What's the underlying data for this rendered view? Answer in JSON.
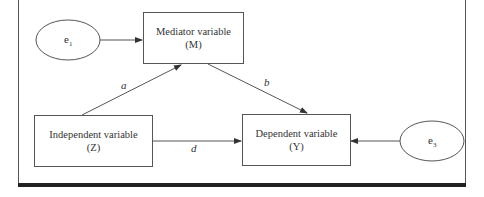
{
  "diagram": {
    "type": "mediation-model",
    "nodes": {
      "mediator": {
        "line1": "Mediator variable",
        "line2": "(M)"
      },
      "independent": {
        "line1": "Independent variable",
        "line2": "(Z)"
      },
      "dependent": {
        "line1": "Dependent variable",
        "line2": "(Y)"
      },
      "e1": {
        "base": "e",
        "sub": "1"
      },
      "e3": {
        "base": "e",
        "sub": "3"
      }
    },
    "paths": {
      "a": "a",
      "b": "b",
      "d": "d"
    },
    "edges": [
      {
        "from": "e1",
        "to": "mediator"
      },
      {
        "from": "independent",
        "to": "mediator",
        "label": "a"
      },
      {
        "from": "mediator",
        "to": "dependent",
        "label": "b"
      },
      {
        "from": "independent",
        "to": "dependent",
        "label": "d"
      },
      {
        "from": "e3",
        "to": "dependent"
      }
    ],
    "colors": {
      "stroke": "#555555",
      "text": "#333333",
      "rule": "#222222"
    }
  }
}
